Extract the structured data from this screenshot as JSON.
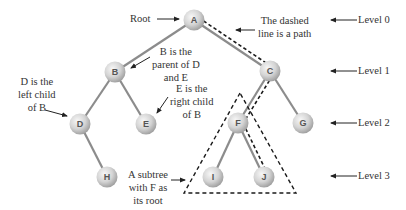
{
  "colors": {
    "edge": "#8c8c8c",
    "dashed": "#1a1a1a",
    "arrow": "#222222",
    "node_light": "#f4f4f4",
    "node_dark": "#a6a6a6",
    "text": "#333333"
  },
  "nodes": [
    {
      "id": "A",
      "label": "A",
      "x": 194,
      "y": 20
    },
    {
      "id": "B",
      "label": "B",
      "x": 115,
      "y": 72
    },
    {
      "id": "C",
      "label": "C",
      "x": 270,
      "y": 71
    },
    {
      "id": "D",
      "label": "D",
      "x": 80,
      "y": 124
    },
    {
      "id": "E",
      "label": "E",
      "x": 146,
      "y": 124
    },
    {
      "id": "F",
      "label": "F",
      "x": 238,
      "y": 123
    },
    {
      "id": "G",
      "label": "G",
      "x": 303,
      "y": 123
    },
    {
      "id": "H",
      "label": "H",
      "x": 107,
      "y": 177
    },
    {
      "id": "I",
      "label": "I",
      "x": 213,
      "y": 177
    },
    {
      "id": "J",
      "label": "J",
      "x": 264,
      "y": 177
    }
  ],
  "edges": [
    [
      "A",
      "B"
    ],
    [
      "A",
      "C"
    ],
    [
      "B",
      "D"
    ],
    [
      "B",
      "E"
    ],
    [
      "D",
      "H"
    ],
    [
      "C",
      "F"
    ],
    [
      "C",
      "G"
    ],
    [
      "F",
      "I"
    ],
    [
      "F",
      "J"
    ]
  ],
  "path": [
    "A",
    "C",
    "F",
    "J"
  ],
  "subtree_triangle": {
    "apex": [
      240,
      93
    ],
    "left": [
      184,
      193
    ],
    "right": [
      296,
      193
    ]
  },
  "annotations": {
    "root": "Root",
    "path": [
      "The dashed",
      "line is a path"
    ],
    "parent": [
      "B is the",
      "parent of D",
      "and E"
    ],
    "left_child": [
      "D is the",
      "left child",
      "of B"
    ],
    "right_child": [
      "E is the",
      "right child",
      "of B"
    ],
    "subtree": [
      "A subtree",
      "with F as",
      "its root"
    ]
  },
  "levels": [
    {
      "label": "Level 0",
      "y": 20
    },
    {
      "label": "Level 1",
      "y": 71
    },
    {
      "label": "Level 2",
      "y": 123
    },
    {
      "label": "Level 3",
      "y": 177
    }
  ]
}
